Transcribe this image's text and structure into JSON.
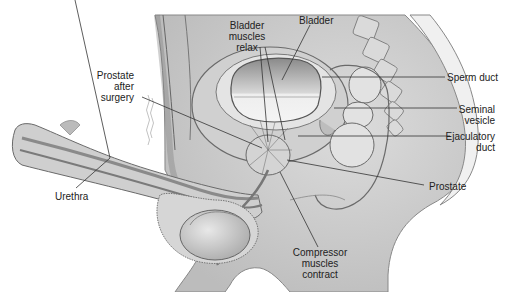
{
  "diagram": {
    "type": "anatomical-illustration",
    "labels": {
      "bladder_muscles_relax": [
        "Bladder",
        "muscles",
        "relax"
      ],
      "bladder": "Bladder",
      "prostate_after_surgery": [
        "Prostate",
        "after",
        "surgery"
      ],
      "sperm_duct": "Sperm duct",
      "seminal_vesicle": [
        "Seminal",
        "vesicle"
      ],
      "ejaculatory_duct": [
        "Ejaculatory",
        "duct"
      ],
      "urethra": "Urethra",
      "prostate": "Prostate",
      "compressor_muscles_contract": [
        "Compressor",
        "muscles",
        "contract"
      ]
    },
    "colors": {
      "background": "#ffffff",
      "tissue_light": "#e6e6e6",
      "tissue_mid": "#c8c8c8",
      "tissue_dark": "#9a9a9a",
      "outline": "#6a6a6a",
      "leader_line": "#333333",
      "text": "#222222"
    }
  }
}
